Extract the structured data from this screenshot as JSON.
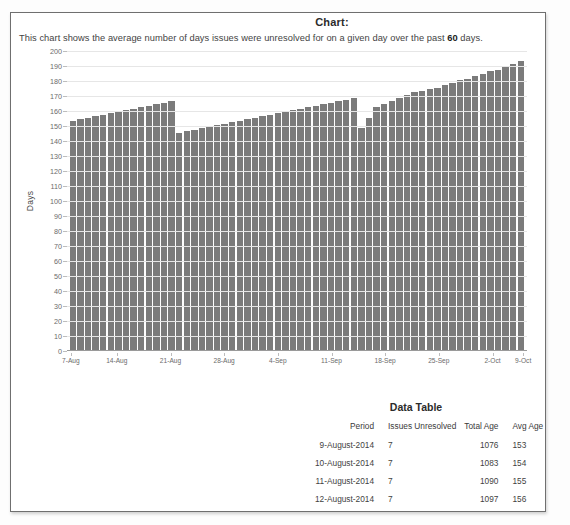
{
  "page": {
    "chart_title": "Chart:",
    "description_prefix": "This chart shows the average number of days issues were unresolved for on a given day over the past ",
    "description_emphasis": "60",
    "description_suffix": " days."
  },
  "chart_data": {
    "type": "bar",
    "title": "Chart:",
    "xlabel": "",
    "ylabel": "Days",
    "ylim": [
      0,
      200
    ],
    "ytick_step": 10,
    "grid": true,
    "legend": "none",
    "bar_color": "#7b7b7b",
    "yticks": [
      200,
      190,
      180,
      170,
      160,
      150,
      140,
      130,
      120,
      110,
      100,
      90,
      80,
      70,
      60,
      50,
      40,
      30,
      20,
      10,
      0
    ],
    "xtick_labels": [
      "7-Aug",
      "14-Aug",
      "21-Aug",
      "28-Aug",
      "4-Sep",
      "11-Sep",
      "18-Sep",
      "25-Sep",
      "2-Oct",
      "9-Oct"
    ],
    "xtick_indices": [
      0,
      6,
      13,
      20,
      27,
      34,
      41,
      48,
      55,
      59
    ],
    "categories": [
      "7-Aug",
      "8-Aug",
      "9-Aug",
      "10-Aug",
      "11-Aug",
      "12-Aug",
      "13-Aug",
      "14-Aug",
      "15-Aug",
      "16-Aug",
      "17-Aug",
      "18-Aug",
      "19-Aug",
      "20-Aug",
      "21-Aug",
      "22-Aug",
      "23-Aug",
      "24-Aug",
      "25-Aug",
      "26-Aug",
      "27-Aug",
      "28-Aug",
      "29-Aug",
      "30-Aug",
      "31-Aug",
      "1-Sep",
      "2-Sep",
      "3-Sep",
      "4-Sep",
      "5-Sep",
      "6-Sep",
      "7-Sep",
      "8-Sep",
      "9-Sep",
      "10-Sep",
      "11-Sep",
      "12-Sep",
      "13-Sep",
      "14-Sep",
      "15-Sep",
      "16-Sep",
      "17-Sep",
      "18-Sep",
      "19-Sep",
      "20-Sep",
      "21-Sep",
      "22-Sep",
      "23-Sep",
      "24-Sep",
      "25-Sep",
      "26-Sep",
      "27-Sep",
      "28-Sep",
      "29-Sep",
      "30-Sep",
      "1-Oct",
      "2-Oct",
      "3-Oct",
      "4-Oct",
      "5-Oct"
    ],
    "values": [
      153,
      154,
      155,
      156,
      157,
      158,
      159,
      160,
      161,
      162,
      163,
      164,
      165,
      166,
      145,
      146,
      147,
      148,
      149,
      150,
      151,
      152,
      153,
      154,
      155,
      156,
      157,
      158,
      159,
      160,
      161,
      162,
      163,
      164,
      165,
      166,
      167,
      168,
      148,
      155,
      162,
      164,
      166,
      168,
      170,
      172,
      173,
      174,
      175,
      177,
      178,
      180,
      181,
      183,
      184,
      186,
      187,
      189,
      191,
      193
    ]
  },
  "data_table": {
    "title": "Data Table",
    "columns": [
      "Period",
      "Issues Unresolved",
      "Total Age",
      "Avg Age"
    ],
    "rows": [
      {
        "period": "9-August-2014",
        "unresolved": "7",
        "total_age": "1076",
        "avg_age": "153"
      },
      {
        "period": "10-August-2014",
        "unresolved": "7",
        "total_age": "1083",
        "avg_age": "154"
      },
      {
        "period": "11-August-2014",
        "unresolved": "7",
        "total_age": "1090",
        "avg_age": "155"
      },
      {
        "period": "12-August-2014",
        "unresolved": "7",
        "total_age": "1097",
        "avg_age": "156"
      }
    ]
  }
}
